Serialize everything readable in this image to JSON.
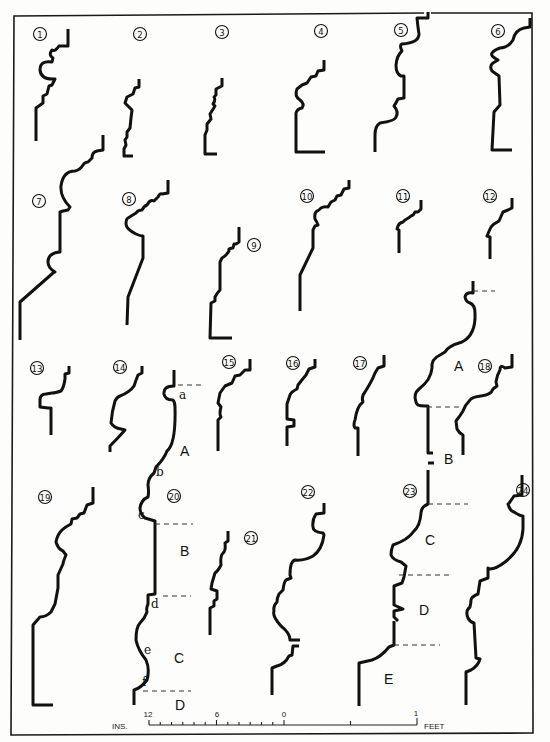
{
  "figure": {
    "title": "",
    "frame": {
      "x1": 14,
      "y1": 13,
      "x2": 533,
      "y2": 735,
      "gap_top": [
        154,
        157
      ]
    },
    "ink_color": "#111111",
    "paper_color": "#fdfdfb"
  },
  "profiles": [
    {
      "id": "1",
      "label": "1",
      "cx": 40,
      "cy": 34,
      "path": "M68,29 L68,46 L59,46 Q55,52 52,50 Q48,55 53,58 L52,62 Q40,60 40,70 Q41,80 55,79 L52,85 L49,86 L47,94 L43,96 L43,103 L36,108 L36,141"
    },
    {
      "id": "2",
      "label": "2",
      "cx": 140,
      "cy": 34,
      "path": "M139,79 L139,87 L135,88 L133,94 L127,97 L125,103 Q129,107 132,110 L131,118 L130,128 L127,132 L127,137 L125,140 L126,145 L124,149 L124,156 L133,156"
    },
    {
      "id": "3",
      "label": "3",
      "cx": 222,
      "cy": 32,
      "path": "M222,78 L222,86 L216,89 L216,95 L214,97 Q216,100 213,104 L215,106 L210,114 L211,119 L207,124 L207,130 L205,135 L205,154 L217,154"
    },
    {
      "id": "4",
      "label": "4",
      "cx": 321,
      "cy": 31,
      "path": "M324,60 L324,70 L318,71 L316,76 L311,77 L307,83 L302,85 L297,89 Q294,96 300,100 Q305,104 302,108 Q297,109 296,113 L296,152 L325,152"
    },
    {
      "id": "5",
      "label": "5",
      "cx": 401,
      "cy": 30,
      "path": "M428,12 L428,18 L417,18 Q418,28 419,34 Q419,43 402,44 Q399,45 402,51 Q397,55 396,65 Q396,74 401,76 L404,76 L404,98 L398,99 Q396,103 394,106 Q399,112 396,117 Q395,121 380,123 Q375,126 375,135 L375,152"
    },
    {
      "id": "6",
      "label": "6",
      "cx": 498,
      "cy": 31,
      "path": "M530,18 L530,27 L524,28 Q515,30 513,40 Q508,48 500,48 Q494,50 492,53 Q490,56 498,60 L493,63 Q489,66 492,71 L499,76 L500,105 L494,112 L492,150 L512,150"
    },
    {
      "id": "7",
      "label": "7",
      "cx": 39,
      "cy": 201,
      "path": "M103,135 L103,150 L97,151 Q92,152 92,158 L88,162 Q85,162 83,165 Q80,170 75,171 Q63,171 61,186 Q60,197 70,207 L68,210 L63,211 L60,212 L60,252 Q48,253 48,262 Q48,268 55,272 L53,273 L20,302 L20,340"
    },
    {
      "id": "8",
      "label": "8",
      "cx": 129,
      "cy": 199,
      "path": "M168,180 L168,193 L162,194 Q160,193 158,197 L154,201 Q150,199 147,205 Q144,206 142,210 Q138,210 136,213 L128,218 Q126,219 126,224 Q126,229 136,234 Q140,236 143,236 L143,258 L128,297 L127,325"
    },
    {
      "id": "9",
      "label": "9",
      "cx": 254,
      "cy": 245,
      "path": "M239,227 L239,242 L236,244 L234,244 L233,248 Q228,248 229,251 Q226,256 222,258 L220,262 L220,290 Q217,293 215,297 L215,301 L211,303 L210,338 L232,338"
    },
    {
      "id": "10",
      "label": "10",
      "cx": 307,
      "cy": 196,
      "path": "M349,180 L349,188 L344,189 L341,195 L337,196 L335,200 L331,202 L328,207 Q324,206 321,208 Q318,211 317,211 Q314,213 315,219 Q317,222 318,225 L315,226 L313,230 L313,248 L300,275 L300,311"
    },
    {
      "id": "11",
      "label": "11",
      "cx": 403,
      "cy": 196,
      "path": "M421,200 L421,209 L418,212 L415,212 Q414,215 411,216 Q409,218 405,220 L403,222 Q399,223 398,226 L397,229 L399,230 L399,253"
    },
    {
      "id": "12",
      "label": "12",
      "cx": 490,
      "cy": 196,
      "path": "M512,198 L512,208 L508,210 L503,212 L499,221 L494,224 Q491,226 490,229 L487,236 L490,237 L490,259"
    },
    {
      "id": "13",
      "label": "13",
      "cx": 37,
      "cy": 368,
      "path": "M69,366 L69,373 L65,374 L65,379 Q64,387 61,391 Q55,393 52,393 L46,394 Q40,394 40,400 L40,407 L48,408 L51,408 L51,435"
    },
    {
      "id": "14",
      "label": "14",
      "cx": 120,
      "cy": 367,
      "path": "M142,366 L142,373 L138,375 Q136,380 134,386 Q130,392 120,396 Q117,397 115,401 Q112,411 111,423 Q114,428 121,429 L125,430 Q118,438 110,446 L110,452"
    },
    {
      "id": "15",
      "label": "15",
      "cx": 229,
      "cy": 362,
      "path": "M250,359 L250,370 L245,370 L240,375 L235,376 L232,383 L225,386 L220,393 L218,403 L221,407 Q219,414 221,417 L218,420 L218,451"
    },
    {
      "id": "16",
      "label": "16",
      "cx": 293,
      "cy": 363,
      "path": "M315,359 L315,367 L309,369 L306,375 Q301,381 298,385 L297,389 Q291,392 290,395 L287,404 L287,419 L294,420 L294,426 L287,427 L287,446"
    },
    {
      "id": "17",
      "label": "17",
      "cx": 360,
      "cy": 363,
      "path": "M384,355 L384,366 L378,368 L375,373 Q372,381 365,392 Q361,397 363,402 Q357,406 355,420 Q353,425 355,428 L358,428 L358,456"
    },
    {
      "id": "18",
      "label": "18",
      "cx": 485,
      "cy": 366,
      "path": "M512,354 L512,367 L505,368 Q500,364 500,370 Q497,375 496,382 L497,386 L493,389 Q491,395 481,396 Q472,397 470,400 Q465,405 463,411 Q460,416 456,421 L457,429 Q459,433 463,435 L463,455"
    },
    {
      "id": "19",
      "label": "19",
      "cx": 45,
      "cy": 497,
      "path": "M93,487 L93,503 L87,505 L84,513 L80,514 L77,518 L72,519 L71,524 Q65,527 62,530 Q57,535 56,542 Q58,549 63,551 L66,555 Q63,562 63,564 L58,575 L58,588 L55,604 L51,612 Q46,617 40,617 L33,625 L33,705 L53,705"
    },
    {
      "id": "20",
      "label": "20",
      "cx": 174,
      "cy": 496,
      "path": "M174,370 L174,386 Q163,386 164,394 Q165,400 173,400 Q175,402 175,407 Q176,444 167,451 Q164,459 156,467 L154,473 Q148,478 148,485 Q149,492 148,497 Q141,500 140,508 Q140,514 145,518 L155,521 L155,594 L148,595 L148,604 Q146,608 147,612 Q145,618 140,623 Q136,627 136,640 Q138,650 146,660 Q150,669 147,680 Q141,688 134,690 L134,705"
    },
    {
      "id": "21",
      "label": "21",
      "cx": 251,
      "cy": 538,
      "path": "M228,531 L228,541 L225,543 Q226,551 223,553 Q220,556 221,565 Q218,571 215,573 L212,583 L211,589 L217,591 L217,599 L214,601 L214,606 L210,608 L210,635"
    },
    {
      "id": "22",
      "label": "22",
      "cx": 308,
      "cy": 492,
      "path": "M324,503 L324,513 L316,514 Q312,520 313,527 Q313,532 323,533 L324,535 Q322,550 313,556 Q304,561 295,560 Q290,561 290,575 L291,578 L286,580 Q284,582 283,590 L279,594 Q277,598 277,602 Q273,606 274,611 Q272,616 281,626 Q290,633 290,640 L300,640 M299,646 L293,646 L292,655 L289,656 Q285,664 277,666 L272,668 L272,695"
    },
    {
      "id": "23",
      "label": "23",
      "cx": 410,
      "cy": 491,
      "path": "M428,470 L428,504 Q421,507 421,513 Q420,526 414,531 Q408,540 393,545 Q391,550 391,555 Q393,560 401,562 L406,566 L404,577 L402,583 L394,586 L394,605 L403,609 L394,611 L394,617 L398,621 M394,621 L394,645 L389,647 Q381,657 372,660 L359,663 L359,706"
    },
    {
      "id": "24",
      "label": "24",
      "cx": 523,
      "cy": 490,
      "path": "M522,475 L522,495 L514,496 Q508,505 508,504 Q510,511 514,512 Q520,516 523,516 L523,529 Q522,549 505,562 Q496,569 490,569 L488,568 L488,578 L480,581 L478,594 Q471,597 471,600 Q471,603 470,607 Q465,611 468,618 Q470,622 474,623 L476,658 L480,659 Q478,666 471,670 L466,672 L466,705"
    }
  ],
  "callout_lines": [
    {
      "id": "20-a",
      "x1": 178,
      "y1": 385,
      "x2": 203,
      "y2": 385
    },
    {
      "id": "20-c",
      "x1": 155,
      "y1": 524,
      "x2": 193,
      "y2": 524
    },
    {
      "id": "20-d",
      "x1": 163,
      "y1": 596,
      "x2": 191,
      "y2": 596
    },
    {
      "id": "20-f",
      "x1": 143,
      "y1": 691,
      "x2": 191,
      "y2": 691
    },
    {
      "id": "18A-top",
      "x1": 473,
      "y1": 291,
      "x2": 495,
      "y2": 291
    },
    {
      "id": "18A-bottom",
      "x1": 427,
      "y1": 407,
      "x2": 460,
      "y2": 407
    },
    {
      "id": "23-c-top",
      "x1": 428,
      "y1": 504,
      "x2": 468,
      "y2": 504
    },
    {
      "id": "23-d-top",
      "x1": 399,
      "y1": 575,
      "x2": 453,
      "y2": 575
    },
    {
      "id": "23-e-top",
      "x1": 394,
      "y1": 645,
      "x2": 440,
      "y2": 645
    }
  ],
  "extra_profiles": [
    {
      "id": "A-large",
      "path": "M473,281 L473,293 Q466,292 465,297 Q466,302 470,303 Q475,305 475,313 Q476,335 462,342 Q448,346 445,352 L440,355 Q431,359 432,368 Q431,380 419,389 Q413,394 416,402 Q416,406 425,406 L428,406 L428,453 L433,453 M428,463 L434,463"
    }
  ],
  "segment_labels": [
    {
      "text": "A",
      "x": 180,
      "y": 456,
      "kind": "segment"
    },
    {
      "text": "B",
      "x": 180,
      "y": 556,
      "kind": "segment"
    },
    {
      "text": "C",
      "x": 174,
      "y": 663,
      "kind": "segment"
    },
    {
      "text": "D",
      "x": 175,
      "y": 710,
      "kind": "segment"
    },
    {
      "text": "A",
      "x": 454,
      "y": 371,
      "kind": "segment"
    },
    {
      "text": "B",
      "x": 444,
      "y": 464,
      "kind": "segment"
    },
    {
      "text": "C",
      "x": 425,
      "y": 545,
      "kind": "segment"
    },
    {
      "text": "D",
      "x": 419,
      "y": 615,
      "kind": "segment"
    },
    {
      "text": "E",
      "x": 384,
      "y": 684,
      "kind": "segment"
    }
  ],
  "point_labels": [
    {
      "text": "a",
      "x": 179,
      "y": 399
    },
    {
      "text": "b",
      "x": 156,
      "y": 476
    },
    {
      "text": "c",
      "x": 138,
      "y": 519
    },
    {
      "text": "d",
      "x": 151,
      "y": 608
    },
    {
      "text": "e",
      "x": 144,
      "y": 654
    },
    {
      "text": "f",
      "x": 142,
      "y": 686
    }
  ],
  "scale_bar": {
    "left_label": "INS.",
    "right_label": "FEET",
    "tick_labels": [
      {
        "text": "12",
        "x": 148
      },
      {
        "text": "6",
        "x": 217
      },
      {
        "text": "0",
        "x": 284
      }
    ],
    "end_label": {
      "text": "1",
      "x": 416
    },
    "x_start": 149,
    "x_zero": 284,
    "x_end": 417,
    "y": 725
  }
}
